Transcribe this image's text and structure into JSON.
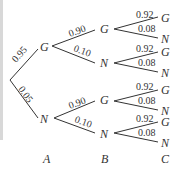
{
  "diagram": {
    "type": "probability-tree",
    "stages": [
      "A",
      "B",
      "C"
    ],
    "stage_A": {
      "branches": [
        {
          "outcome": "G",
          "prob": "0.95"
        },
        {
          "outcome": "N",
          "prob": "0.05"
        }
      ]
    },
    "stage_B": {
      "from_G": [
        {
          "outcome": "G",
          "prob": "0.90"
        },
        {
          "outcome": "N",
          "prob": "0.10"
        }
      ],
      "from_N": [
        {
          "outcome": "G",
          "prob": "0.90"
        },
        {
          "outcome": "N",
          "prob": "0.10"
        }
      ]
    },
    "stage_C": {
      "from_GG": [
        {
          "outcome": "G",
          "prob": "0.92"
        },
        {
          "outcome": "N",
          "prob": "0.08"
        }
      ],
      "from_GN": [
        {
          "outcome": "G",
          "prob": "0.92"
        },
        {
          "outcome": "N",
          "prob": "0.08"
        }
      ],
      "from_NG": [
        {
          "outcome": "G",
          "prob": "0.92"
        },
        {
          "outcome": "N",
          "prob": "0.08"
        }
      ],
      "from_NN": [
        {
          "outcome": "G",
          "prob": "0.92"
        },
        {
          "outcome": "N",
          "prob": "0.08"
        }
      ]
    }
  }
}
